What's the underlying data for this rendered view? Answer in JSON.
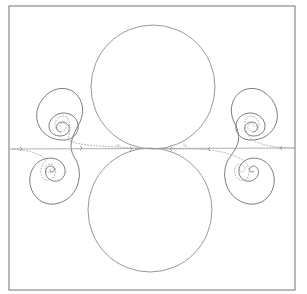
{
  "figure": {
    "frame": {
      "x": 9,
      "y": 6,
      "width": 286,
      "height": 284,
      "stroke": "#8a8a8a"
    },
    "circles": [
      {
        "name": "upper-circle",
        "cx": 153,
        "cy": 87,
        "r": 62
      },
      {
        "name": "lower-circle",
        "cx": 150,
        "cy": 210,
        "r": 62
      }
    ],
    "tangent_point": {
      "x": 152,
      "y": 149
    },
    "spirals": [
      {
        "name": "left-upper-spiral",
        "cx": 61,
        "cy": 127
      },
      {
        "name": "left-lower-spiral",
        "cx": 50,
        "cy": 169
      },
      {
        "name": "right-upper-spiral",
        "cx": 253,
        "cy": 127
      },
      {
        "name": "right-lower-spiral",
        "cx": 240,
        "cy": 169
      }
    ],
    "flow_line_labels": {
      "left": "½",
      "right": "½"
    },
    "colors": {
      "circle": "#8c8c8c",
      "spiral_outer": "#6e6e6e",
      "spiral_inner": "#a8a8a8",
      "background": "#ffffff"
    }
  }
}
